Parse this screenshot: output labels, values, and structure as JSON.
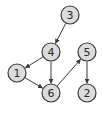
{
  "diagram": {
    "type": "directed-graph",
    "node_style": {
      "fill": "#dcdcdc",
      "stroke": "#3a3a3a",
      "radius": 9
    },
    "edge_color": "#3a3a3a",
    "nodes": [
      {
        "id": "3",
        "label": "3",
        "x": 70,
        "y": 15
      },
      {
        "id": "4",
        "label": "4",
        "x": 51,
        "y": 52
      },
      {
        "id": "1",
        "label": "1",
        "x": 17,
        "y": 73
      },
      {
        "id": "6",
        "label": "6",
        "x": 51,
        "y": 93
      },
      {
        "id": "5",
        "label": "5",
        "x": 87,
        "y": 52
      },
      {
        "id": "2",
        "label": "2",
        "x": 87,
        "y": 93
      }
    ],
    "edges": [
      {
        "from": "3",
        "to": "4"
      },
      {
        "from": "4",
        "to": "1"
      },
      {
        "from": "4",
        "to": "6"
      },
      {
        "from": "1",
        "to": "6"
      },
      {
        "from": "6",
        "to": "5"
      },
      {
        "from": "5",
        "to": "2"
      }
    ]
  }
}
